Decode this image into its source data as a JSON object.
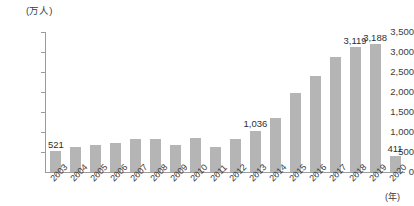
{
  "chart_data": {
    "type": "bar",
    "title": "",
    "subtitle": "",
    "xlabel": "(年)",
    "ylabel": "(万人)",
    "ylim": [
      0,
      3500
    ],
    "ytick_step": 500,
    "ytick_labels": [
      "0",
      "500",
      "1,000",
      "1,500",
      "2,000",
      "2,500",
      "3,000",
      "3,500"
    ],
    "ytick_values": [
      0,
      500,
      1000,
      1500,
      2000,
      2500,
      3000,
      3500
    ],
    "grid": false,
    "legend": null,
    "bar_color": "#b5b5b5",
    "categories": [
      "2003",
      "2004",
      "2005",
      "2006",
      "2007",
      "2008",
      "2009",
      "2010",
      "2011",
      "2012",
      "2013",
      "2014",
      "2015",
      "2016",
      "2017",
      "2018",
      "2019",
      "2020"
    ],
    "values": [
      521,
      614,
      673,
      733,
      835,
      835,
      679,
      861,
      622,
      836,
      1036,
      1341,
      1974,
      2404,
      2869,
      3119,
      3188,
      411
    ],
    "data_labels": [
      {
        "category": "2003",
        "text": "521"
      },
      {
        "category": "2013",
        "text": "1,036"
      },
      {
        "category": "2018",
        "text": "3,119"
      },
      {
        "category": "2019",
        "text": "3,188"
      },
      {
        "category": "2020",
        "text": "411"
      }
    ]
  }
}
